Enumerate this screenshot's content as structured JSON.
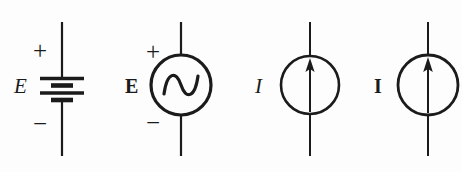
{
  "figure": {
    "background_color": "#fdfdfd",
    "stroke_color": "#1b1b1b",
    "width": 462,
    "height": 172
  },
  "symbols": [
    {
      "id": "dc-voltage-source",
      "type": "battery",
      "label": "E",
      "label_style": "italic",
      "polarity_top": "+",
      "polarity_bottom": "−",
      "center_x": 62,
      "description": "Battery / DC voltage source: stacked long and short plates"
    },
    {
      "id": "ac-voltage-source",
      "type": "circle-sine",
      "label": "E",
      "label_style": "bold",
      "polarity_top": "+",
      "polarity_bottom": "−",
      "center_x": 181,
      "description": "AC voltage source: circle enclosing a sine wave"
    },
    {
      "id": "dc-current-source",
      "type": "circle-arrow",
      "label": "I",
      "label_style": "italic",
      "polarity_top": "",
      "polarity_bottom": "",
      "center_x": 310,
      "description": "DC current source: circle enclosing an upward arrow"
    },
    {
      "id": "ac-current-source",
      "type": "circle-arrow",
      "label": "I",
      "label_style": "bold",
      "polarity_top": "",
      "polarity_bottom": "",
      "center_x": 428,
      "description": "AC current source: circle enclosing an upward arrow"
    }
  ]
}
